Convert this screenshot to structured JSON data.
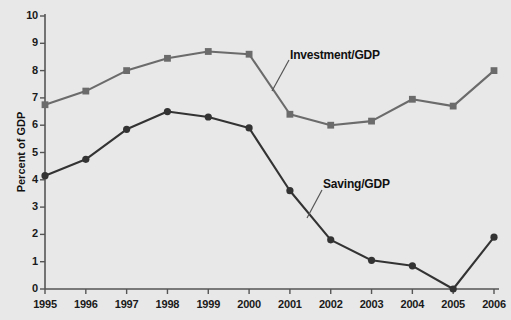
{
  "chart_data": {
    "type": "line",
    "title": "",
    "subtitle": "",
    "xlabel": "",
    "ylabel": "Percent of GDP",
    "categories": [
      "1995",
      "1996",
      "1997",
      "1998",
      "1999",
      "2000",
      "2001",
      "2002",
      "2003",
      "2004",
      "2005",
      "2006"
    ],
    "x": [
      1995,
      1996,
      1997,
      1998,
      1999,
      2000,
      2001,
      2002,
      2003,
      2004,
      2005,
      2006
    ],
    "ylim": [
      0,
      10
    ],
    "xlim": [
      1995,
      2006
    ],
    "yticks": [
      "0",
      "1",
      "2",
      "3",
      "4",
      "5",
      "6",
      "7",
      "8",
      "9",
      "10"
    ],
    "ytick_values": [
      0,
      1,
      2,
      3,
      4,
      5,
      6,
      7,
      8,
      9,
      10
    ],
    "grid": false,
    "legend_position": "inline-annotation",
    "series": [
      {
        "name": "Investment/GDP",
        "color": "#6b6b6b",
        "marker": "square",
        "values": [
          6.75,
          7.25,
          8.0,
          8.45,
          8.7,
          8.6,
          6.4,
          6.0,
          6.15,
          6.95,
          6.7,
          8.0
        ]
      },
      {
        "name": "Saving/GDP",
        "color": "#333333",
        "marker": "circle",
        "values": [
          4.15,
          4.75,
          5.85,
          6.5,
          6.3,
          5.9,
          3.6,
          1.8,
          1.05,
          0.85,
          0.0,
          1.9
        ]
      }
    ],
    "annotations": [
      {
        "text": "Investment/GDP",
        "series": "Investment/GDP"
      },
      {
        "text": "Saving/GDP",
        "series": "Saving/GDP"
      }
    ]
  },
  "style": {
    "background": "#e8e8e8",
    "axis_color": "#555555",
    "text_color": "#111111"
  }
}
